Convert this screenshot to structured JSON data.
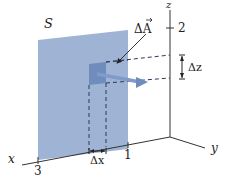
{
  "diagram": {
    "type": "surface-area-element-3d",
    "surface_label": "S",
    "vector_label": "ΔA",
    "axes": {
      "x": {
        "label": "x",
        "ticks": [
          {
            "value": "3"
          },
          {
            "value": "1"
          }
        ]
      },
      "y": {
        "label": "y"
      },
      "z": {
        "label": "z",
        "ticks": [
          {
            "value": "2"
          }
        ]
      }
    },
    "increments": {
      "dx_label": "Δx",
      "dz_label": "Δz"
    },
    "colors": {
      "surface": "#9fb4d4",
      "patch": "#6f8cbc",
      "axis": "#333333",
      "dashed": "#2b3a55",
      "vector": "#7f9acb"
    }
  }
}
